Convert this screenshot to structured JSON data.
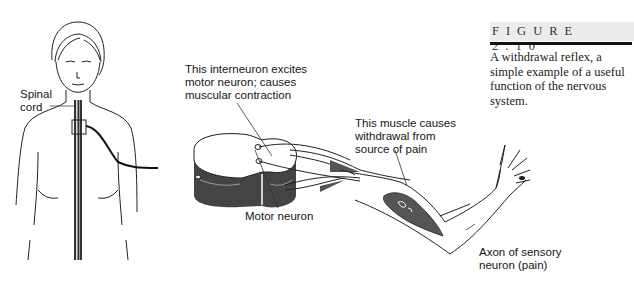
{
  "figure": {
    "number_label": "FIGURE 2.10",
    "caption": "A withdrawal reflex, a simple example of a useful function of the nervous system."
  },
  "labels": {
    "spinal_cord": [
      "Spinal",
      "cord"
    ],
    "interneuron": [
      "This interneuron excites",
      "motor neuron;  causes",
      "muscular contraction"
    ],
    "motor_neuron": "Motor neuron",
    "muscle": [
      "This muscle causes",
      "withdrawal from",
      "source of pain"
    ],
    "sensory_axon": [
      "Axon of sensory",
      "neuron (pain)"
    ]
  },
  "body_text_cutoff": "The ... (partially visible body text line)"
}
